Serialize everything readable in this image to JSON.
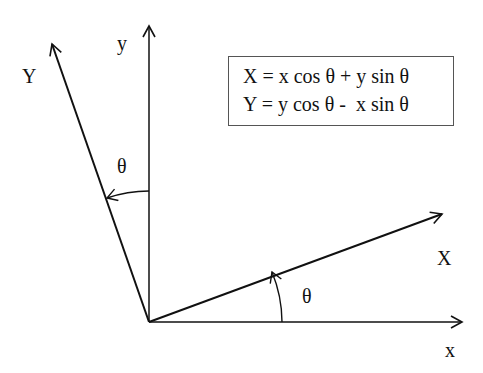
{
  "diagram": {
    "axes": {
      "x_label": "x",
      "y_label": "y",
      "X_label": "X",
      "Y_label": "Y"
    },
    "angle_label_upper": "θ",
    "angle_label_lower": "θ",
    "equations": {
      "line1": "X = x cos θ + y sin θ",
      "line2": "Y = y cos θ -  x sin θ"
    }
  }
}
